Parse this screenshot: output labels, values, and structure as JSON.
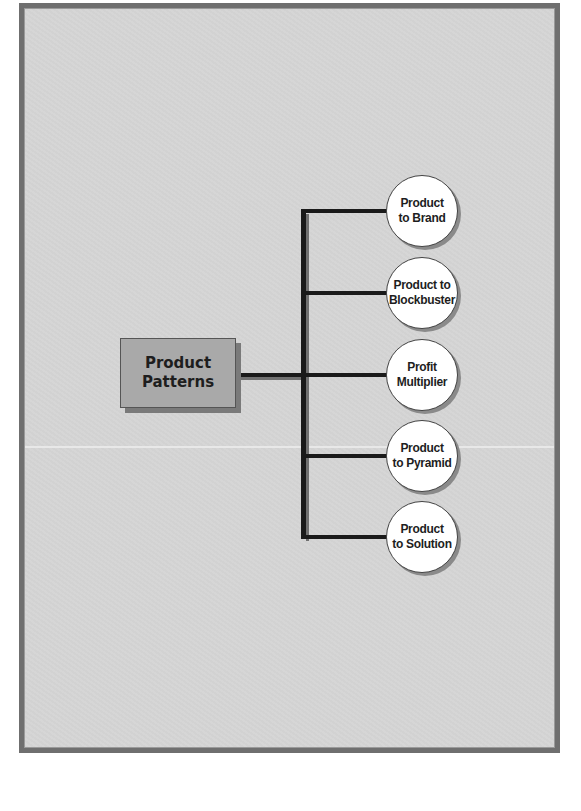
{
  "diagram": {
    "root": {
      "label_line1": "Product",
      "label_line2": "Patterns"
    },
    "nodes": [
      {
        "label_line1": "Product",
        "label_line2": "to Brand"
      },
      {
        "label_line1": "Product to",
        "label_line2": "Blockbuster"
      },
      {
        "label_line1": "Profit",
        "label_line2": "Multiplier"
      },
      {
        "label_line1": "Product",
        "label_line2": "to Pyramid"
      },
      {
        "label_line1": "Product",
        "label_line2": "to Solution"
      }
    ],
    "colors": {
      "background": "#d3d3d3",
      "frame_border": "#6f6f6f",
      "root_fill": "#a9a9a9",
      "connector": "#1a1a1a",
      "node_fill": "#ffffff"
    }
  }
}
